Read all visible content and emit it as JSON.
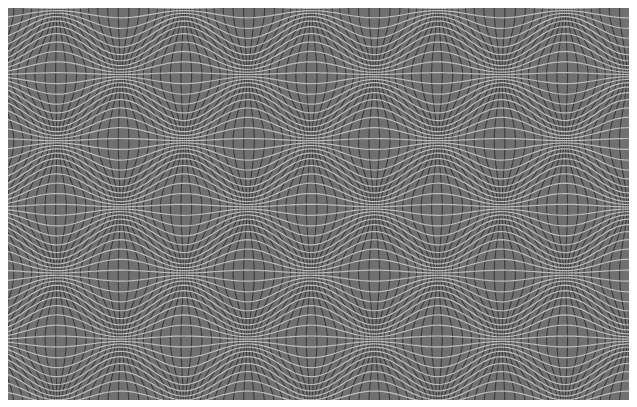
{
  "image": {
    "description": "Optical illusion: grey field with dark vertical and light horizontal wavy lines forming a checkerboard of bulges and pinches",
    "canvas": {
      "width": 637,
      "height": 407,
      "background": "#ffffff"
    },
    "pattern_box": {
      "x": 8,
      "y": 8,
      "width": 621,
      "height": 392
    },
    "colors": {
      "field": "#707070",
      "vertical_lines": "#3a3a3a",
      "horizontal_lines": "#bdbdbd"
    },
    "grid": {
      "vertical_spacing_px": 6.3,
      "horizontal_spacing_px": 6.6,
      "vertical_line_width": 1.1,
      "horizontal_line_width": 1.2
    },
    "distortion": {
      "period_x": 127,
      "period_y": 132.5,
      "bulge_origin_x": 57,
      "bulge_origin_y": 75,
      "amplitude": 14
    }
  }
}
